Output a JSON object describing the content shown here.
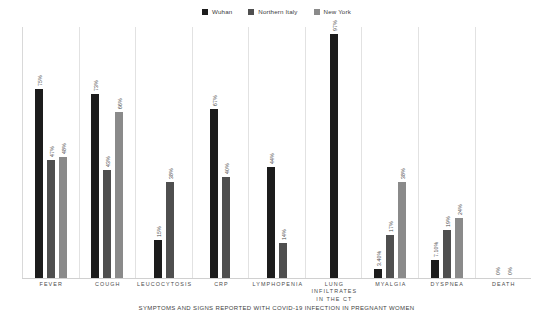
{
  "legend": {
    "position": "top-center",
    "items": [
      {
        "label": "Wuhan",
        "color": "#1c1c1c",
        "icon": "square-swatch-icon"
      },
      {
        "label": "Northern Italy",
        "color": "#4f4f4f",
        "icon": "square-swatch-icon"
      },
      {
        "label": "New York",
        "color": "#8a8a8a",
        "icon": "square-swatch-icon"
      }
    ]
  },
  "chart_data": {
    "type": "bar",
    "title": "",
    "xlabel": "SYMPTOMS AND SIGNS REPORTED WITH COVID-19 INFECTION IN PREGNANT WOMEN",
    "ylabel": "",
    "ylim": [
      0,
      100
    ],
    "grid": false,
    "legend_position": "top-center",
    "categories": [
      "FEVER",
      "COUGH",
      "LEUCOCYTOSIS",
      "CRP",
      "LYMPHOPENIA",
      "LUNG INFILTRATES IN THE CT",
      "MYALGIA",
      "DYSPNEA",
      "DEATH"
    ],
    "series": [
      {
        "name": "Wuhan",
        "color": "#1c1c1c",
        "values": [
          75,
          73,
          15,
          67,
          44,
          97,
          3.4,
          7.1,
          0
        ],
        "labels": [
          "75%",
          "73%",
          "15%",
          "67%",
          "44%",
          "97%",
          "3.40%",
          "7.10%",
          "0%"
        ]
      },
      {
        "name": "Northern Italy",
        "color": "#4f4f4f",
        "values": [
          47,
          43,
          38,
          40,
          14,
          null,
          17,
          19,
          0
        ],
        "labels": [
          "47%",
          "43%",
          "38%",
          "40%",
          "14%",
          "",
          "17%",
          "19%",
          "0%"
        ]
      },
      {
        "name": "New York",
        "color": "#8a8a8a",
        "values": [
          48,
          66,
          null,
          null,
          null,
          null,
          38,
          24,
          null
        ],
        "labels": [
          "48%",
          "66%",
          "",
          "",
          "",
          "",
          "38%",
          "24%",
          ""
        ]
      }
    ]
  }
}
